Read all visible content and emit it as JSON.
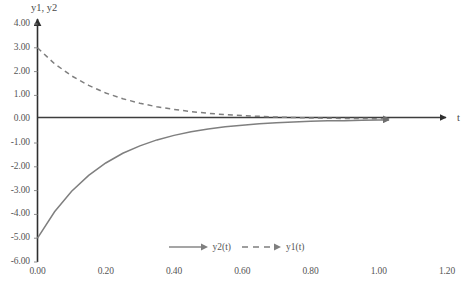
{
  "chart_data": {
    "type": "line",
    "title": "",
    "xlabel": "t",
    "ylabel": "y1, y2",
    "xlim": [
      0.0,
      1.2
    ],
    "ylim": [
      -6.0,
      4.0
    ],
    "grid": false,
    "legend_position": "bottom-center",
    "xticks": [
      "0.00",
      "0.20",
      "0.40",
      "0.60",
      "0.80",
      "1.00",
      "1.20"
    ],
    "xtick_values": [
      0.0,
      0.2,
      0.4,
      0.6,
      0.8,
      1.0,
      1.2
    ],
    "yticks": [
      "4.00",
      "3.00",
      "2.00",
      "1.00",
      "0.00",
      "-1.00",
      "-2.00",
      "-3.00",
      "-4.00",
      "-5.00",
      "-6.00"
    ],
    "ytick_values": [
      4.0,
      3.0,
      2.0,
      1.0,
      0.0,
      -1.0,
      -2.0,
      -3.0,
      -4.0,
      -5.0,
      -6.0
    ],
    "series": [
      {
        "name": "y2(t)",
        "style": "solid",
        "color": "#7f7f7f",
        "marker": "arrow-end",
        "x": [
          0.0,
          0.05,
          0.1,
          0.15,
          0.2,
          0.25,
          0.3,
          0.35,
          0.4,
          0.45,
          0.5,
          0.55,
          0.6,
          0.65,
          0.7,
          0.75,
          0.8,
          0.85,
          0.9,
          0.95,
          1.0,
          1.03
        ],
        "values": [
          -5.0,
          -3.89,
          -3.03,
          -2.36,
          -1.84,
          -1.43,
          -1.12,
          -0.87,
          -0.68,
          -0.53,
          -0.41,
          -0.32,
          -0.25,
          -0.19,
          -0.15,
          -0.12,
          -0.09,
          -0.07,
          -0.06,
          -0.04,
          -0.03,
          -0.03
        ]
      },
      {
        "name": "y1(t)",
        "style": "dashed",
        "color": "#7f7f7f",
        "marker": "arrow-end",
        "x": [
          0.0,
          0.05,
          0.1,
          0.15,
          0.2,
          0.25,
          0.3,
          0.35,
          0.4,
          0.45,
          0.5,
          0.55,
          0.6,
          0.65,
          0.7,
          0.75,
          0.8,
          0.85,
          0.9,
          0.95,
          1.0,
          1.03
        ],
        "values": [
          3.0,
          2.33,
          1.82,
          1.42,
          1.1,
          0.86,
          0.67,
          0.52,
          0.41,
          0.32,
          0.25,
          0.19,
          0.15,
          0.12,
          0.09,
          0.07,
          0.05,
          0.04,
          0.03,
          0.03,
          0.02,
          0.02
        ]
      }
    ]
  },
  "axes": {
    "y_title": "y1, y2",
    "x_title": "t"
  },
  "legend": {
    "entries": [
      {
        "label": "y2(t)",
        "style": "solid"
      },
      {
        "label": "y1(t)",
        "style": "dashed"
      }
    ]
  },
  "caption": {
    "text": ""
  },
  "colors": {
    "curve": "#7f7f7f",
    "axis": "#3d3d3d",
    "text": "#555555"
  }
}
